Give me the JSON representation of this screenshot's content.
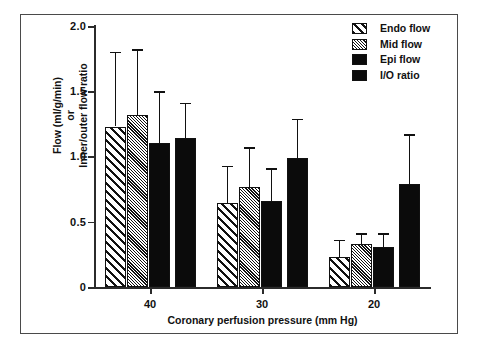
{
  "chart_data": {
    "type": "bar",
    "title": "",
    "xlabel": "Coronary perfusion pressure (mm Hg)",
    "ylabel": "Flow (ml/g/min) or Inner/outer flow ratio",
    "ylabel_lines": [
      "Flow (ml/g/min)",
      "or",
      "Inner/outer flow ratio"
    ],
    "categories": [
      "40",
      "30",
      "20"
    ],
    "ylim": [
      0,
      2.0
    ],
    "yticks": [
      "0",
      "0.5",
      "1.0",
      "1.5",
      "2.0"
    ],
    "ytick_values": [
      0,
      0.5,
      1.0,
      1.5,
      2.0
    ],
    "grid": false,
    "legend_position": "top-right",
    "series": [
      {
        "name": "Endo flow",
        "fill": "wide-diagonal-hatch",
        "values": [
          1.23,
          0.64,
          0.23
        ],
        "errors_upper": [
          1.8,
          0.93,
          0.36
        ]
      },
      {
        "name": "Mid flow",
        "fill": "fine-dense-hatch",
        "values": [
          1.32,
          0.77,
          0.33
        ],
        "errors_upper": [
          1.82,
          1.07,
          0.41
        ]
      },
      {
        "name": "Epi flow",
        "fill": "solid-black",
        "values": [
          1.1,
          0.66,
          0.31
        ],
        "errors_upper": [
          1.5,
          0.91,
          0.41
        ]
      },
      {
        "name": "I/O ratio",
        "fill": "solid-black",
        "values": [
          1.14,
          0.99,
          0.79
        ],
        "errors_upper": [
          1.41,
          1.29,
          1.17
        ]
      }
    ]
  },
  "legend": {
    "items": [
      {
        "label": "Endo flow",
        "swatch": "wide-diagonal-hatch"
      },
      {
        "label": "Mid flow",
        "swatch": "fine-dense-hatch"
      },
      {
        "label": "Epi flow",
        "swatch": "solid-black"
      },
      {
        "label": "I/O ratio",
        "swatch": "solid-black"
      }
    ]
  },
  "axes": {
    "x_title": "Coronary perfusion pressure (mm Hg)",
    "y_title_line1": "Flow (ml/g/min)",
    "y_title_line2": "or",
    "y_title_line3": "Inner/outer flow ratio",
    "x_tick_labels": [
      "40",
      "30",
      "20"
    ],
    "y_tick_labels": [
      "2.0",
      "1.5",
      "1.0",
      "0.5",
      "0"
    ]
  },
  "colors": {
    "ink": "#111111",
    "frame": "#4a4a4a",
    "background": "#ffffff",
    "solid_fill": "#0b0b0b"
  }
}
